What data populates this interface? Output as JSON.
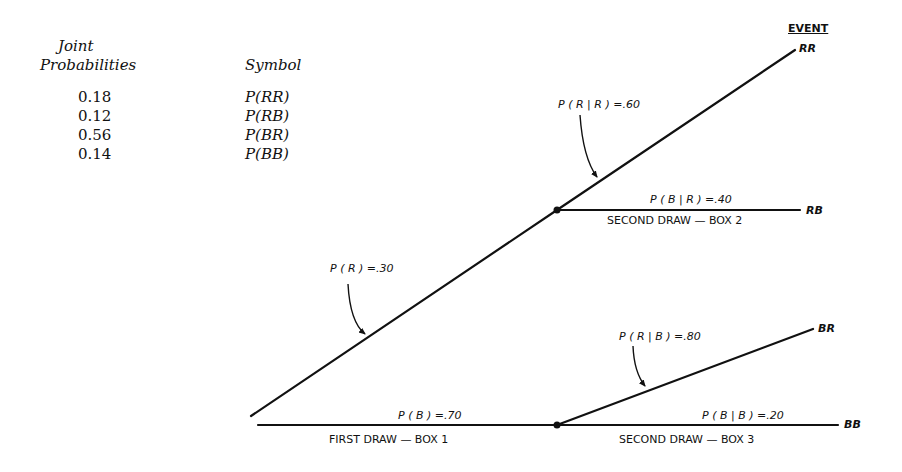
{
  "table": {
    "header_joint_line1": "Joint",
    "header_joint_line2": "Probabilities",
    "header_symbol": "Symbol",
    "rows": [
      {
        "probability": "0.18",
        "symbol": "P(RR)"
      },
      {
        "probability": "0.12",
        "symbol": "P(RB)"
      },
      {
        "probability": "0.56",
        "symbol": "P(BR)"
      },
      {
        "probability": "0.14",
        "symbol": "P(BB)"
      }
    ]
  },
  "tree": {
    "event_header": "EVENT",
    "events": {
      "rr": "RR",
      "rb": "RB",
      "br": "BR",
      "bb": "BB"
    },
    "branch_labels": {
      "p_r": "P ( R ) =.30",
      "p_b": "P ( B ) =.70",
      "p_r_given_r": "P ( R | R ) =.60",
      "p_b_given_r": "P ( B | R ) =.40",
      "p_r_given_b": "P ( R | B ) =.80",
      "p_b_given_b": "P ( B | B ) =.20"
    },
    "stage_labels": {
      "first": "FIRST DRAW — BOX 1",
      "second_box2": "SECOND DRAW — BOX 2",
      "second_box3": "SECOND DRAW — BOX 3"
    }
  }
}
